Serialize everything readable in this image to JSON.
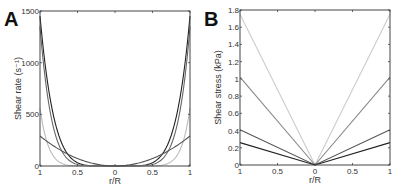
{
  "chart_data": [
    {
      "panel": "A",
      "type": "line",
      "title": "",
      "xlabel": "r/R",
      "ylabel": "Shear rate (s⁻¹)",
      "xlim": [
        -1,
        1
      ],
      "ylim": [
        0,
        1500
      ],
      "xticks": [
        "1",
        "0.5",
        "0",
        "0.5",
        "1"
      ],
      "yticks": [
        "0",
        "500",
        "1000",
        "1500"
      ],
      "grid": false,
      "legend": null,
      "series": [
        {
          "name": "curve-1",
          "color": "#222222",
          "edge_value": 1450,
          "shape": "power",
          "exponent": 5.5
        },
        {
          "name": "curve-2",
          "color": "#666666",
          "edge_value": 1350,
          "shape": "power",
          "exponent": 6.5
        },
        {
          "name": "curve-3",
          "color": "#bbbbbb",
          "edge_value": 560,
          "shape": "power",
          "exponent": 9
        },
        {
          "name": "curve-4",
          "color": "#555555",
          "edge_value": 290,
          "shape": "power",
          "exponent": 2
        }
      ]
    },
    {
      "panel": "B",
      "type": "line",
      "title": "",
      "xlabel": "r/R",
      "ylabel": "Shear stress (kPa)",
      "xlim": [
        -1,
        1
      ],
      "ylim": [
        0,
        1.8
      ],
      "xticks": [
        "1",
        "0.5",
        "0",
        "0.5",
        "1"
      ],
      "yticks": [
        "0",
        "0.2",
        "0.4",
        "0.6",
        "0.8",
        "1",
        "1.2",
        "1.4",
        "1.6",
        "1.8"
      ],
      "grid": false,
      "legend": null,
      "series": [
        {
          "name": "line-1",
          "color": "#cccccc",
          "edge_value": 1.75
        },
        {
          "name": "line-2",
          "color": "#888888",
          "edge_value": 1.02
        },
        {
          "name": "line-3",
          "color": "#555555",
          "edge_value": 0.41
        },
        {
          "name": "line-4",
          "color": "#222222",
          "edge_value": 0.26
        }
      ]
    }
  ],
  "panels": {
    "a": {
      "label": "A"
    },
    "b": {
      "label": "B"
    }
  }
}
